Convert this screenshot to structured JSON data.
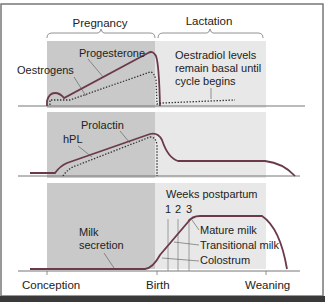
{
  "phases": {
    "pregnancy": "Pregnancy",
    "lactation": "Lactation"
  },
  "panel1": {
    "labels": {
      "progesterone": "Progesterone",
      "oestrogens": "Oestrogens",
      "note_line1": "Oestradiol levels",
      "note_line2": "remain basal until",
      "note_line3": "cycle begins"
    }
  },
  "panel2": {
    "labels": {
      "prolactin": "Prolactin",
      "hpl": "hPL"
    }
  },
  "panel3": {
    "labels": {
      "milk_secretion_line1": "Milk",
      "milk_secretion_line2": "secretion",
      "weeks_postpartum": "Weeks postpartum",
      "week1": "1",
      "week2": "2",
      "week3": "3",
      "mature_milk": "Mature milk",
      "transitional_milk": "Transitional milk",
      "colostrum": "Colostrum"
    }
  },
  "x_axis": {
    "conception": "Conception",
    "birth": "Birth",
    "weaning": "Weaning"
  },
  "colors": {
    "curve": "#6b3a4a",
    "shade_dark": "#c8c8c8",
    "shade_light": "#e6e6e6",
    "frame": "#555555",
    "bottom_bar": "#3a3a3a"
  }
}
